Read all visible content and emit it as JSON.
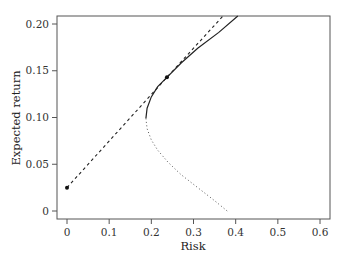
{
  "chart_data": {
    "type": "line",
    "title": "",
    "xlabel": "Risk",
    "ylabel": "Expected return",
    "xlim": [
      -0.02,
      0.63
    ],
    "ylim": [
      -0.008,
      0.2086
    ],
    "x_ticks": [
      0,
      0.1,
      0.2,
      0.3,
      0.4,
      0.5,
      0.6
    ],
    "x_tick_labels": [
      "0",
      "0.1",
      "0.2",
      "0.3",
      "0.4",
      "0.5",
      "0.6"
    ],
    "y_ticks": [
      0,
      0.05,
      0.1,
      0.15,
      0.2
    ],
    "y_tick_labels": [
      "0",
      "0.05",
      "0.10",
      "0.15",
      "0.20"
    ],
    "grid": false,
    "legend": null,
    "series": [
      {
        "name": "Efficient frontier (upper branch)",
        "style": "solid",
        "points": [
          [
            0.187,
            0.099
          ],
          [
            0.19,
            0.11
          ],
          [
            0.2,
            0.122
          ],
          [
            0.215,
            0.133
          ],
          [
            0.237,
            0.143
          ],
          [
            0.27,
            0.158
          ],
          [
            0.31,
            0.174
          ],
          [
            0.36,
            0.191
          ],
          [
            0.405,
            0.2086
          ]
        ]
      },
      {
        "name": "Minimum-variance frontier (lower branch)",
        "style": "dotted",
        "points": [
          [
            0.187,
            0.099
          ],
          [
            0.19,
            0.088
          ],
          [
            0.2,
            0.076
          ],
          [
            0.215,
            0.065
          ],
          [
            0.24,
            0.052
          ],
          [
            0.27,
            0.039
          ],
          [
            0.31,
            0.025
          ],
          [
            0.35,
            0.011
          ],
          [
            0.38,
            0.0
          ]
        ]
      },
      {
        "name": "Capital market line",
        "style": "dashed",
        "points": [
          [
            0,
            0.025
          ],
          [
            0.237,
            0.143
          ],
          [
            0.37,
            0.2086
          ]
        ]
      },
      {
        "name": "Key points",
        "style": "markers",
        "points": [
          [
            0,
            0.025
          ],
          [
            0.237,
            0.143
          ]
        ]
      }
    ]
  }
}
